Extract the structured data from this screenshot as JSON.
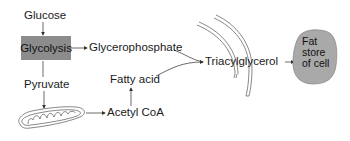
{
  "diagram": {
    "nodes": {
      "glucose": "Glucose",
      "glycolysis": "Glycolysis",
      "glycerophosphate": "Glycerophosphate",
      "pyruvate": "Pyruvate",
      "fatty_acid": "Fatty acid",
      "acetyl_coa": "Acetyl CoA",
      "triacylglycerol": "Triacylglycerol",
      "fat_store_line1": "Fat",
      "fat_store_line2": "store",
      "fat_store_line3": "of cell"
    },
    "edges": [
      {
        "from": "Glucose",
        "to": "Glycolysis"
      },
      {
        "from": "Glycolysis",
        "to": "Glycerophosphate"
      },
      {
        "from": "Glycolysis",
        "to": "Pyruvate"
      },
      {
        "from": "Pyruvate",
        "to": "Mitochondrion"
      },
      {
        "from": "Mitochondrion",
        "to": "Acetyl CoA"
      },
      {
        "from": "Acetyl CoA",
        "to": "Fatty acid"
      },
      {
        "from": "Glycerophosphate",
        "to": "Triacylglycerol"
      },
      {
        "from": "Fatty acid",
        "to": "Triacylglycerol"
      },
      {
        "from": "Triacylglycerol",
        "to": "Fat store of cell"
      }
    ],
    "icons": [
      "mitochondrion-icon",
      "endoplasmic-reticulum-icon",
      "fat-droplet-icon"
    ],
    "colors": {
      "glycolysis_box": "#8c8c8c",
      "fat_store": "#a8a8a8",
      "line": "#444444"
    }
  }
}
